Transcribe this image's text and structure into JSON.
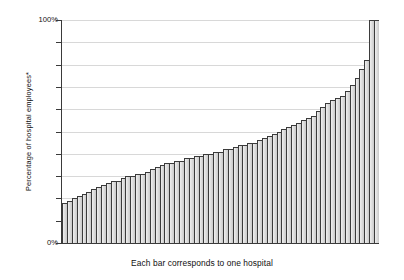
{
  "chart_data": {
    "type": "bar",
    "title": "",
    "subtitle": "",
    "xlabel": "Each bar corresponds to one hospital",
    "ylabel": "Percentage of hospital employees*",
    "ylim": [
      0,
      100
    ],
    "yticks": [
      0,
      10,
      20,
      30,
      40,
      50,
      60,
      70,
      80,
      90,
      100
    ],
    "ytick_labels_visible": [
      "0%",
      "100%"
    ],
    "grid": true,
    "legend": null,
    "categories": [
      "hospital-01",
      "hospital-02",
      "hospital-03",
      "hospital-04",
      "hospital-05",
      "hospital-06",
      "hospital-07",
      "hospital-08",
      "hospital-09",
      "hospital-10",
      "hospital-11",
      "hospital-12",
      "hospital-13",
      "hospital-14",
      "hospital-15",
      "hospital-16",
      "hospital-17",
      "hospital-18",
      "hospital-19",
      "hospital-20",
      "hospital-21",
      "hospital-22",
      "hospital-23",
      "hospital-24",
      "hospital-25",
      "hospital-26",
      "hospital-27",
      "hospital-28",
      "hospital-29",
      "hospital-30",
      "hospital-31",
      "hospital-32",
      "hospital-33",
      "hospital-34",
      "hospital-35",
      "hospital-36",
      "hospital-37",
      "hospital-38",
      "hospital-39",
      "hospital-40",
      "hospital-41",
      "hospital-42",
      "hospital-43",
      "hospital-44",
      "hospital-45",
      "hospital-46",
      "hospital-47",
      "hospital-48",
      "hospital-49",
      "hospital-50",
      "hospital-51",
      "hospital-52",
      "hospital-53",
      "hospital-54",
      "hospital-55",
      "hospital-56",
      "hospital-57",
      "hospital-58",
      "hospital-59",
      "hospital-60",
      "hospital-61",
      "hospital-62",
      "hospital-63",
      "hospital-64",
      "hospital-65"
    ],
    "values": [
      18,
      19,
      20,
      21,
      22,
      23,
      24,
      25,
      26,
      27,
      28,
      28,
      29,
      30,
      30,
      31,
      31,
      32,
      33,
      34,
      35,
      36,
      36,
      37,
      37,
      38,
      38,
      39,
      39,
      40,
      40,
      41,
      41,
      42,
      42,
      43,
      44,
      44,
      45,
      45,
      46,
      47,
      48,
      49,
      50,
      51,
      52,
      53,
      54,
      55,
      56,
      57,
      59,
      61,
      63,
      64,
      65,
      66,
      68,
      71,
      74,
      78,
      82,
      100,
      100
    ]
  },
  "axis": {
    "y_top_label": "100%",
    "y_bottom_label": "0%",
    "y_title": "Percentage of hospital employees*"
  },
  "caption": {
    "text": "Each bar corresponds to one hospital"
  },
  "colors": {
    "bar_fill": "#c9c9c9",
    "bar_edge": "#3b3b3b",
    "gridline": "#d8d8d8",
    "axis": "#3a3a3a",
    "text": "#111111",
    "background": "#ffffff"
  }
}
